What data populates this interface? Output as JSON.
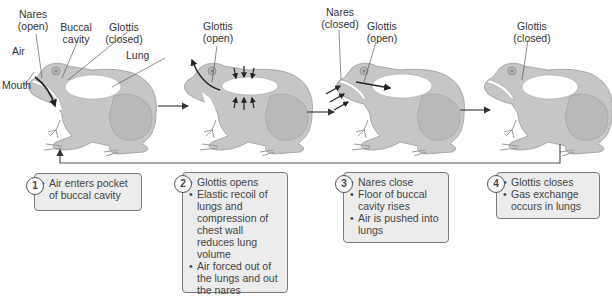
{
  "figure": {
    "stages": [
      {
        "step": "1",
        "labels": {
          "nares": "Nares",
          "nares_state": "(open)",
          "buccal": "Buccal",
          "buccal2": "cavity",
          "glottis": "Glottis",
          "glottis_state": "(closed)",
          "air": "Air",
          "lung": "Lung",
          "mouth": "Mouth"
        },
        "bullets": [
          "Air enters pocket of buccal cavity"
        ]
      },
      {
        "step": "2",
        "labels": {
          "glottis": "Glottis",
          "glottis_state": "(open)"
        },
        "bullets": [
          "Glottis opens",
          "Elastic recoil of lungs and compression of chest wall reduces lung volume",
          "Air forced out of the lungs and out the nares"
        ]
      },
      {
        "step": "3",
        "labels": {
          "nares": "Nares",
          "nares_state": "(closed)",
          "glottis": "Glottis",
          "glottis_state": "(open)"
        },
        "bullets": [
          "Nares close",
          "Floor of buccal cavity rises",
          "Air is pushed into lungs"
        ]
      },
      {
        "step": "4",
        "labels": {
          "glottis": "Glottis",
          "glottis_state": "(closed)"
        },
        "bullets": [
          "Glottis closes",
          "Gas exchange occurs in lungs"
        ]
      }
    ],
    "colors": {
      "frog_body": "#c4c4c4",
      "frog_shadow": "#a9a9a9",
      "lung": "#ffffff",
      "arrow": "#333333",
      "box_fill": "#ececec",
      "box_border": "#7a7a7a"
    }
  }
}
